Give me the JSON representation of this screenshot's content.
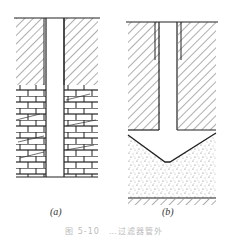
{
  "figure": {
    "panels": [
      {
        "id": "a",
        "label": "(a)",
        "description": "Well bore through clay layer into brick-like fractured rock layer"
      },
      {
        "id": "b",
        "label": "(b)",
        "description": "Well bore through clay layer ending in V-shaped cavity in sand layer"
      }
    ],
    "caption": "图 5-10　…过滤器管外"
  }
}
